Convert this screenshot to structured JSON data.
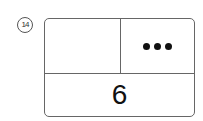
{
  "question": {
    "number": "14",
    "number_label": "⑭"
  },
  "box": {
    "top_left": "",
    "top_right": {
      "dot_count": 3,
      "icon": "three-dots"
    },
    "bottom": "6"
  }
}
